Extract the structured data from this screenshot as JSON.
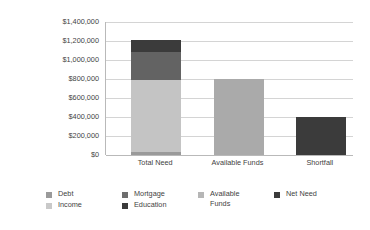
{
  "chart_data": {
    "type": "bar",
    "title": "",
    "subtitle": "",
    "xlabel": "",
    "ylabel": "$ of Life Insurance",
    "ylim": [
      0,
      1400000
    ],
    "ytick_values": [
      0,
      200000,
      400000,
      600000,
      800000,
      1000000,
      1200000,
      1400000
    ],
    "ytick_labels": [
      "$0",
      "$200,000",
      "$400,000",
      "$600,000",
      "$800,000",
      "$1,000,000",
      "$1,200,000",
      "$1,400,000"
    ],
    "categories": [
      "Total Need",
      "Available Funds",
      "Shortfall"
    ],
    "grid": "horizontal",
    "legend_position": "bottom",
    "stacked": true,
    "series": [
      {
        "name": "Debt",
        "color": "#9a9a9a",
        "values": [
          30000,
          null,
          null
        ]
      },
      {
        "name": "Income",
        "color": "#c4c4c4",
        "values": [
          760000,
          null,
          null
        ]
      },
      {
        "name": "Mortgage",
        "color": "#636363",
        "values": [
          290000,
          null,
          null
        ]
      },
      {
        "name": "Education",
        "color": "#3b3b3b",
        "values": [
          130000,
          null,
          null
        ]
      },
      {
        "name": "Available Funds",
        "color": "#aaaaaa",
        "values": [
          null,
          800000,
          null
        ]
      },
      {
        "name": "Net Need",
        "color": "#3b3b3b",
        "values": [
          null,
          null,
          400000
        ]
      }
    ],
    "bar_totals": [
      1210000,
      800000,
      400000
    ],
    "legend_entries": [
      {
        "label": "Debt",
        "color": "#9a9a9a"
      },
      {
        "label": "Income",
        "color": "#c9c9c9"
      },
      {
        "label": "Mortgage",
        "color": "#6e6e6e"
      },
      {
        "label": "Education",
        "color": "#3b3b3b"
      },
      {
        "label": "Available Funds",
        "color": "#b6b6b6"
      },
      {
        "label": "Net Need",
        "color": "#3b3b3b"
      }
    ]
  }
}
